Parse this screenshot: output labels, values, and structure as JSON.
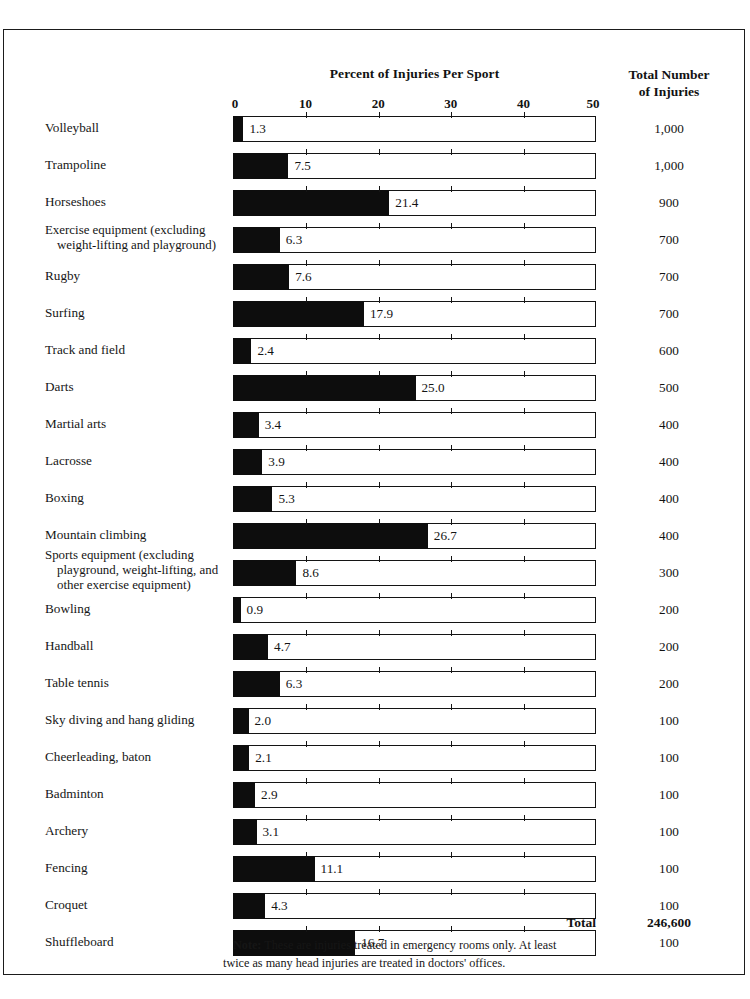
{
  "chart_data": {
    "type": "bar",
    "title": "Percent of Injuries Per Sport",
    "xlabel": "",
    "ylabel": "",
    "xlim": [
      0,
      50
    ],
    "xticks": [
      0,
      10,
      20,
      30,
      40,
      50
    ],
    "grid": false,
    "orientation": "horizontal",
    "second_column_header_line1": "Total Number",
    "second_column_header_line2": "of Injuries",
    "categories": [
      "Volleyball",
      "Trampoline",
      "Horseshoes",
      "Exercise equipment (excluding weight-lifting and playground)",
      "Rugby",
      "Surfing",
      "Track and field",
      "Darts",
      "Martial arts",
      "Lacrosse",
      "Boxing",
      "Mountain climbing",
      "Sports equipment (excluding playground, weight-lifting, and other exercise equipment)",
      "Bowling",
      "Handball",
      "Table tennis",
      "Sky diving and hang gliding",
      "Cheerleading, baton",
      "Badminton",
      "Archery",
      "Fencing",
      "Croquet",
      "Shuffleboard"
    ],
    "values": [
      1.3,
      7.5,
      21.4,
      6.3,
      7.6,
      17.9,
      2.4,
      25.0,
      3.4,
      3.9,
      5.3,
      26.7,
      8.6,
      0.9,
      4.7,
      6.3,
      2.0,
      2.1,
      2.9,
      3.1,
      11.1,
      4.3,
      16.7
    ],
    "totals": [
      1000,
      1000,
      900,
      700,
      700,
      700,
      600,
      500,
      400,
      400,
      400,
      400,
      300,
      200,
      200,
      200,
      100,
      100,
      100,
      100,
      100,
      100,
      100
    ],
    "total_label": "Total",
    "total_value": "246,600",
    "note": "Note: These are injuries treated in emergency rooms only. At least twice as many head injuries are treated in doctors' offices."
  },
  "header": {
    "chart_title": "Percent of Injuries Per Sport",
    "total_header_line1": "Total Number",
    "total_header_line2": "of Injuries"
  },
  "axis": {
    "ticks": [
      "0",
      "10",
      "20",
      "30",
      "40",
      "50"
    ]
  },
  "rows": [
    {
      "label": "Volleyball",
      "value": "1.3",
      "total": "1,000"
    },
    {
      "label": "Trampoline",
      "value": "7.5",
      "total": "1,000"
    },
    {
      "label": "Horseshoes",
      "value": "21.4",
      "total": "900"
    },
    {
      "label_line1": "Exercise equipment (excluding",
      "label_line2": "weight-lifting and playground)",
      "value": "6.3",
      "total": "700"
    },
    {
      "label": "Rugby",
      "value": "7.6",
      "total": "700"
    },
    {
      "label": "Surfing",
      "value": "17.9",
      "total": "700"
    },
    {
      "label": "Track and field",
      "value": "2.4",
      "total": "600"
    },
    {
      "label": "Darts",
      "value": "25.0",
      "total": "500"
    },
    {
      "label": "Martial arts",
      "value": "3.4",
      "total": "400"
    },
    {
      "label": "Lacrosse",
      "value": "3.9",
      "total": "400"
    },
    {
      "label": "Boxing",
      "value": "5.3",
      "total": "400"
    },
    {
      "label": "Mountain climbing",
      "value": "26.7",
      "total": "400"
    },
    {
      "label_line1": "Sports equipment (excluding",
      "label_line2": "playground, weight-lifting, and",
      "label_line3": "other exercise equipment)",
      "value": "8.6",
      "total": "300"
    },
    {
      "label": "Bowling",
      "value": "0.9",
      "total": "200"
    },
    {
      "label": "Handball",
      "value": "4.7",
      "total": "200"
    },
    {
      "label": "Table tennis",
      "value": "6.3",
      "total": "200"
    },
    {
      "label": "Sky diving and hang gliding",
      "value": "2.0",
      "total": "100"
    },
    {
      "label": "Cheerleading, baton",
      "value": "2.1",
      "total": "100"
    },
    {
      "label": "Badminton",
      "value": "2.9",
      "total": "100"
    },
    {
      "label": "Archery",
      "value": "3.1",
      "total": "100"
    },
    {
      "label": "Fencing",
      "value": "11.1",
      "total": "100"
    },
    {
      "label": "Croquet",
      "value": "4.3",
      "total": "100"
    },
    {
      "label": "Shuffleboard",
      "value": "16.7",
      "total": "100"
    }
  ],
  "footer": {
    "total_label": "Total",
    "total_value": "246,600",
    "note_lead": "Note:",
    "note_line1": " These are injuries treated in emergency rooms only.  At least",
    "note_line2": "twice as many head injuries are treated in doctors' offices."
  },
  "colors": {
    "bar_fill": "#0d0d0d",
    "bar_outline": "#141414",
    "frame": "#1b1b1b",
    "text": "#161616",
    "background": "#ffffff"
  }
}
